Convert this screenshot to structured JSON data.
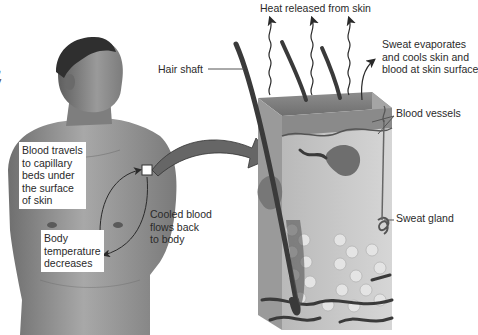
{
  "figure": {
    "colors": {
      "background": "#ffffff",
      "text": "#2a2a2a",
      "skin_tone": "#8a8a8a",
      "arrow": "#333333"
    }
  },
  "left_edge_fragment": {
    "line1": "l,",
    "line2": "y"
  },
  "person": {
    "name": "human-torso-illustration"
  },
  "labels": {
    "heat_released": "Heat released from skin",
    "hair_shaft": "Hair shaft",
    "sweat_evaporates": [
      "Sweat evaporates",
      "and cools skin and",
      "blood at skin surface"
    ],
    "blood_vessels": "Blood vessels",
    "sweat_gland": "Sweat gland",
    "blood_travels": [
      "Blood travels",
      "to capillary",
      "beds under",
      "the surface",
      "of skin"
    ],
    "cooled_blood": [
      "Cooled blood",
      "flows back",
      "to body"
    ],
    "body_temperature": [
      "Body",
      "temperature",
      "decreases"
    ]
  },
  "arrows": {
    "heat_arrows_count": 3,
    "zoom_arrow": "points from skin patch on chest to magnified skin section"
  }
}
